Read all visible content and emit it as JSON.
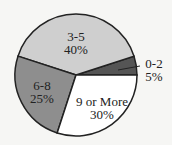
{
  "chart_data": {
    "type": "pie",
    "title": "",
    "slices": [
      {
        "label": "0-2",
        "value": 5,
        "pct_label": "5%",
        "color": "#555555"
      },
      {
        "label": "3-5",
        "value": 40,
        "pct_label": "40%",
        "color": "#cfcfcf"
      },
      {
        "label": "6-8",
        "value": 25,
        "pct_label": "25%",
        "color": "#8e8e8e"
      },
      {
        "label": "9 or More",
        "value": 30,
        "pct_label": "30%",
        "color": "#ffffff"
      }
    ],
    "legend": "none",
    "start_angle_deg": 0,
    "direction": "counter-clockwise"
  }
}
